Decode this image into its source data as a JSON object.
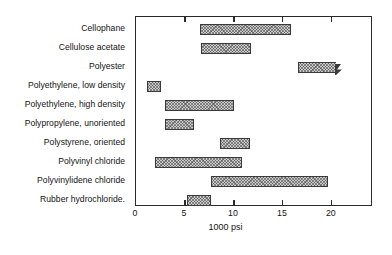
{
  "chart_data": {
    "type": "bar",
    "orientation": "horizontal",
    "subtype": "range-bar",
    "title": "",
    "xlabel": "1000 psi",
    "ylabel": "",
    "xlim": [
      0,
      24.2
    ],
    "xticks": [
      0,
      5,
      10,
      15,
      20
    ],
    "xtick_labels": [
      "0",
      "5",
      "10",
      "15",
      "20"
    ],
    "grid": false,
    "legend": null,
    "categories": [
      "Cellophane",
      "Cellulose acetate",
      "Polyester",
      "Polyethylene, low density",
      "Polyethylene, high density",
      "Polypropylene, unoriented",
      "Polystyrene, oriented",
      "Polyvinyl chloride",
      "Polyvinylidene chloride",
      "Rubber hydrochloride."
    ],
    "ranges": [
      {
        "category": "Cellophane",
        "low": 6.5,
        "high": 15.8,
        "broken_high": false
      },
      {
        "category": "Cellulose acetate",
        "low": 6.6,
        "high": 11.7,
        "broken_high": false
      },
      {
        "category": "Polyester",
        "low": 16.5,
        "high": 20.4,
        "broken_high": true
      },
      {
        "category": "Polyethylene, low density",
        "low": 1.1,
        "high": 2.6,
        "broken_high": false
      },
      {
        "category": "Polyethylene, high density",
        "low": 3.0,
        "high": 10.0,
        "broken_high": false
      },
      {
        "category": "Polypropylene, unoriented",
        "low": 3.0,
        "high": 5.9,
        "broken_high": false
      },
      {
        "category": "Polystyrene, oriented",
        "low": 8.6,
        "high": 11.6,
        "broken_high": false
      },
      {
        "category": "Polyvinyl chloride",
        "low": 1.9,
        "high": 10.8,
        "broken_high": false
      },
      {
        "category": "Polyvinylidene chloride",
        "low": 7.7,
        "high": 19.6,
        "broken_high": false
      },
      {
        "category": "Rubber hydrochloride.",
        "low": 5.2,
        "high": 7.7,
        "broken_high": false
      }
    ],
    "colors": {
      "bar_fill": "#c9c9c9",
      "bar_hatch": "#464646",
      "bar_border": "#3a3a3a",
      "frame": "#2a2a2a",
      "text": "#141414",
      "background": "#ffffff"
    }
  }
}
